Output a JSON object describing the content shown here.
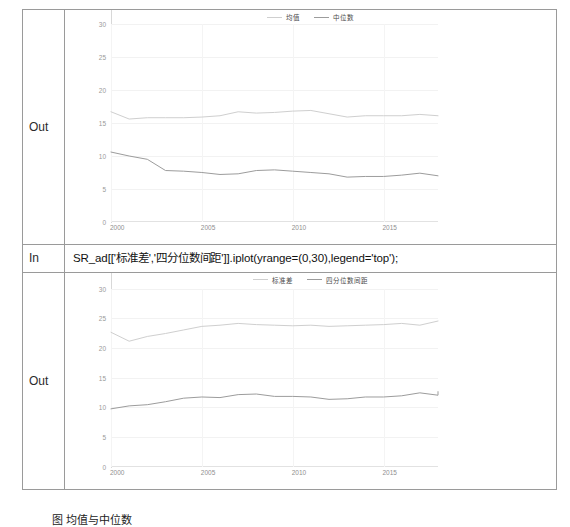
{
  "notebook": {
    "cells": [
      {
        "type": "output",
        "label": "Out",
        "chart_index": 0
      },
      {
        "type": "input",
        "label": "In",
        "code": "SR_ad[['标准差','四分位数间距']].iplot(yrange=(0,30),legend='top');"
      },
      {
        "type": "output",
        "label": "Out",
        "chart_index": 1
      }
    ]
  },
  "caption": "图 均值与中位数",
  "colors": {
    "series_light": "#cfcfcf",
    "series_dark": "#9c9c9c",
    "grid": "#f2f2f2",
    "axis": "#d8d8d8",
    "tick_text": "#9a9a9a",
    "table_border": "#9a9a9a"
  },
  "chart_data": [
    {
      "type": "line",
      "title": "",
      "xlabel": "",
      "ylabel": "",
      "legend_position": "top",
      "grid": true,
      "xlim": [
        2000,
        2018
      ],
      "ylim": [
        0,
        30
      ],
      "xticks": [
        "2000",
        "2005",
        "2010",
        "2015"
      ],
      "xtick_values": [
        2000,
        2005,
        2010,
        2015
      ],
      "yticks": [
        "0",
        "5",
        "10",
        "15",
        "20",
        "25",
        "30"
      ],
      "ytick_values": [
        0,
        5,
        10,
        15,
        20,
        25,
        30
      ],
      "x": [
        2000,
        2001,
        2002,
        2003,
        2004,
        2005,
        2006,
        2007,
        2008,
        2009,
        2010,
        2011,
        2012,
        2013,
        2014,
        2015,
        2016,
        2017,
        2018
      ],
      "series": [
        {
          "name": "均值",
          "color": "#cfcfcf",
          "values": [
            16.7,
            15.6,
            15.8,
            15.8,
            15.8,
            15.9,
            16.1,
            16.7,
            16.5,
            16.6,
            16.8,
            16.9,
            16.4,
            15.9,
            16.1,
            16.1,
            16.1,
            16.3,
            16.1
          ]
        },
        {
          "name": "中位数",
          "color": "#9c9c9c",
          "values": [
            10.6,
            10.0,
            9.5,
            7.8,
            7.7,
            7.5,
            7.2,
            7.3,
            7.8,
            7.9,
            7.7,
            7.5,
            7.3,
            6.8,
            6.9,
            6.9,
            7.1,
            7.4,
            7.0
          ]
        }
      ]
    },
    {
      "type": "line",
      "title": "",
      "xlabel": "",
      "ylabel": "",
      "legend_position": "top",
      "grid": true,
      "xlim": [
        2000,
        2018
      ],
      "ylim": [
        0,
        30
      ],
      "xticks": [
        "2000",
        "2005",
        "2010",
        "2015"
      ],
      "xtick_values": [
        2000,
        2005,
        2010,
        2015
      ],
      "yticks": [
        "0",
        "5",
        "10",
        "15",
        "20",
        "25",
        "30"
      ],
      "ytick_values": [
        0,
        5,
        10,
        15,
        20,
        25,
        30
      ],
      "x": [
        2000,
        2001,
        2002,
        2003,
        2004,
        2005,
        2006,
        2007,
        2008,
        2009,
        2010,
        2011,
        2012,
        2013,
        2014,
        2015,
        2016,
        2017,
        2018
      ],
      "series": [
        {
          "name": "标准差",
          "color": "#cfcfcf",
          "values": [
            22.7,
            21.2,
            22.0,
            22.5,
            23.1,
            23.7,
            23.9,
            24.2,
            24.0,
            23.9,
            23.8,
            23.9,
            23.7,
            23.8,
            23.9,
            24.0,
            24.2,
            23.9,
            24.6
          ]
        },
        {
          "name": "四分位数间距",
          "color": "#9c9c9c",
          "values": [
            9.8,
            10.3,
            10.5,
            11.0,
            11.6,
            11.8,
            11.7,
            12.2,
            12.3,
            11.9,
            11.9,
            11.8,
            11.4,
            11.5,
            11.8,
            11.8,
            12.0,
            12.5,
            12.1,
            12.7
          ]
        }
      ]
    }
  ]
}
